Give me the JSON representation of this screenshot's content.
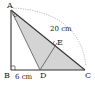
{
  "diagram": {
    "points": {
      "A": {
        "label": "A",
        "x": 11,
        "y": 10
      },
      "B": {
        "label": "B",
        "x": 11,
        "y": 70
      },
      "C": {
        "label": "C",
        "x": 85,
        "y": 70
      },
      "D": {
        "label": "D",
        "x": 40,
        "y": 70
      },
      "E": {
        "label": "E",
        "x": 57,
        "y": 43
      }
    },
    "measurements": {
      "AC": "20 cm",
      "BD": "6 cm"
    },
    "shaded_region": "triangle ADC",
    "colors": {
      "shade": "#d4d4d4",
      "line": "#333333",
      "arc": "#999999"
    }
  }
}
